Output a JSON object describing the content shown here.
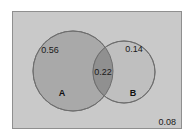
{
  "figure": {
    "name": "venn-diagram-two-sets",
    "background_color": "#ffffff"
  },
  "universal_set": {
    "name": "universe-rectangle",
    "fill_color": "#c9c9c9",
    "border_color": "#8f8f8f",
    "x": 12,
    "y": 11,
    "width": 169,
    "height": 117
  },
  "sets": [
    {
      "id": "A",
      "label": "A",
      "label_x": 62,
      "label_y": 93,
      "cx": 73,
      "cy": 71,
      "r": 40,
      "fill_color": "#a9a9a9",
      "stroke_color": "#6e6e6e"
    },
    {
      "id": "B",
      "label": "B",
      "label_x": 133,
      "label_y": 93,
      "cx": 124,
      "cy": 72,
      "r": 31,
      "fill_color": "#bfbfbf",
      "stroke_color": "#6e6e6e"
    }
  ],
  "intersection": {
    "fill_color": "#909090",
    "stroke_color": "#6e6e6e"
  },
  "chart_data": {
    "type": "venn",
    "title": "",
    "xlabel": "",
    "ylabel": "",
    "set_names": [
      "A",
      "B"
    ],
    "regions": [
      {
        "id": "A-only",
        "sets": [
          "A"
        ],
        "label": "0.56",
        "value": 0.56,
        "x": 50,
        "y": 53
      },
      {
        "id": "A-and-B",
        "sets": [
          "A",
          "B"
        ],
        "label": "0.22",
        "value": 0.22,
        "x": 103,
        "y": 72
      },
      {
        "id": "B-only",
        "sets": [
          "B"
        ],
        "label": "0.14",
        "value": 0.14,
        "x": 134,
        "y": 52
      },
      {
        "id": "outside",
        "sets": [],
        "label": "0.08",
        "value": 0.08,
        "x": 175,
        "y": 122
      }
    ],
    "total": 1.0
  }
}
